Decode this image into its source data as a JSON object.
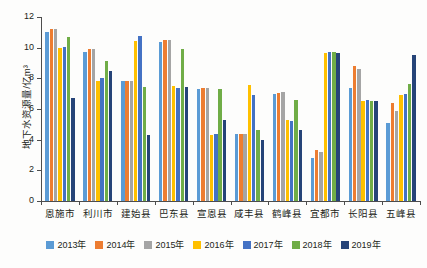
{
  "chart_data": {
    "type": "bar",
    "title": "",
    "xlabel": "",
    "ylabel": "地下水资源量/亿m³",
    "ylim": [
      0,
      12
    ],
    "ytick_labels": [
      "0",
      "2",
      "4",
      "6",
      "8",
      "10",
      "12"
    ],
    "ytick_values": [
      0,
      2,
      4,
      6,
      8,
      10,
      12
    ],
    "grid": false,
    "legend_position": "bottom",
    "categories": [
      "恩施市",
      "利川市",
      "建始县",
      "巴东县",
      "宣恩县",
      "咸丰县",
      "鹤峰县",
      "宜都市",
      "长阳县",
      "五峰县"
    ],
    "series": [
      {
        "name": "2013年",
        "color": "#5b9bd5",
        "values": [
          11.0,
          9.75,
          7.8,
          10.35,
          7.3,
          4.35,
          7.0,
          2.8,
          7.35,
          5.1
        ]
      },
      {
        "name": "2014年",
        "color": "#ed7d31",
        "values": [
          11.2,
          9.9,
          7.85,
          10.5,
          7.35,
          4.35,
          7.05,
          3.35,
          8.8,
          6.4
        ]
      },
      {
        "name": "2015年",
        "color": "#a5a5a5",
        "values": [
          11.2,
          9.9,
          7.85,
          10.5,
          7.35,
          4.4,
          7.1,
          3.2,
          8.6,
          5.9
        ]
      },
      {
        "name": "2016年",
        "color": "#ffc000",
        "values": [
          10.0,
          7.85,
          10.45,
          7.5,
          4.3,
          7.55,
          5.3,
          9.65,
          6.55,
          6.9
        ]
      },
      {
        "name": "2017年",
        "color": "#4472c4",
        "values": [
          10.05,
          8.0,
          10.75,
          7.4,
          4.35,
          6.9,
          5.2,
          9.7,
          6.6,
          7.0
        ]
      },
      {
        "name": "2018年",
        "color": "#70ad47",
        "values": [
          10.7,
          9.1,
          7.45,
          9.9,
          7.3,
          4.6,
          6.6,
          9.7,
          6.5,
          7.6
        ]
      },
      {
        "name": "2019年",
        "color": "#264478",
        "values": [
          6.75,
          8.5,
          4.3,
          7.45,
          5.3,
          4.0,
          4.6,
          9.65,
          6.5,
          9.5
        ]
      }
    ]
  }
}
